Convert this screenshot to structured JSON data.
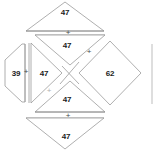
{
  "figure": {
    "title": "",
    "background_color": "#ffffff",
    "stroke_color": "#9a9a9a",
    "fill_color": "#ffffff",
    "text_color": "#1c1c1c",
    "operator_color": "#4a4a4a"
  },
  "cells": [
    {
      "id": "top-outer-triangle",
      "shape": "triangle-up",
      "value": "47",
      "label_x": 65,
      "label_y": 12
    },
    {
      "id": "top-inner-triangle",
      "shape": "triangle-down",
      "value": "47",
      "label_x": 67,
      "label_y": 45
    },
    {
      "id": "left-outer-hexagon",
      "shape": "hexagon",
      "value": "39",
      "label_x": 16,
      "label_y": 73
    },
    {
      "id": "left-inner-triangle",
      "shape": "triangle-right",
      "value": "47",
      "label_x": 44,
      "label_y": 73
    },
    {
      "id": "right-diamond",
      "shape": "diamond",
      "value": "62",
      "label_x": 110,
      "label_y": 73
    },
    {
      "id": "bottom-inner-triangle",
      "shape": "triangle-up",
      "value": "47",
      "label_x": 67,
      "label_y": 99
    },
    {
      "id": "bottom-outer-triangle",
      "shape": "triangle-down",
      "value": "47",
      "label_x": 66,
      "label_y": 136
    }
  ],
  "operators": [
    {
      "id": "op-top",
      "symbol": "+",
      "x": 68,
      "y": 33,
      "faint": false
    },
    {
      "id": "op-upper-right",
      "symbol": "+",
      "x": 89,
      "y": 52,
      "faint": false
    },
    {
      "id": "op-left",
      "symbol": "+",
      "x": 26,
      "y": 72,
      "faint": false
    },
    {
      "id": "op-lower-left",
      "symbol": "+",
      "x": 49,
      "y": 91,
      "faint": true
    },
    {
      "id": "op-bottom",
      "symbol": "+",
      "x": 68,
      "y": 116,
      "faint": false
    }
  ]
}
